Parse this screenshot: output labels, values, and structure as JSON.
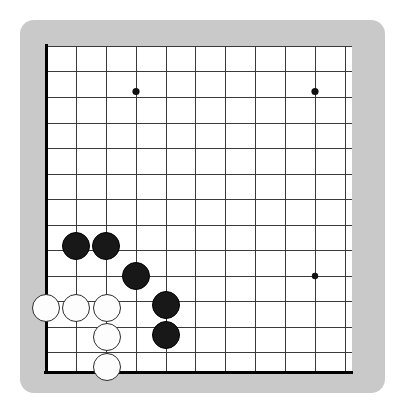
{
  "app": {
    "title": "Go Board",
    "board_type": "go-board",
    "frame_color": "#c9c9c9",
    "surface_color": "#ffffff",
    "line_color": "#3a3a3a",
    "edge_color": "#000000",
    "black_stone_color": "#181818",
    "white_stone_color": "#fdfdfd",
    "white_stone_outline": "#2b2b2b"
  },
  "frame": {
    "x": 20,
    "y": 20,
    "width": 365,
    "height": 373,
    "corner_radius": 14
  },
  "board": {
    "note": "Cropped view of a larger board; only the lower-left portion of the grid is visible",
    "columns_visible": 11,
    "rows_visible": 14,
    "column_spacing": 30,
    "row_spacing": 25.2,
    "origin_x": 46,
    "origin_y": 46.5,
    "left_edge_x": 46,
    "bottom_edge_y": 372,
    "right_cut_x": 352,
    "top_cut_y": 46,
    "vertical_lines_x": [
      46,
      76,
      106,
      136,
      166,
      195,
      225,
      255,
      285,
      315,
      345
    ],
    "horizontal_lines_y": [
      46.5,
      71.5,
      97,
      123,
      148.5,
      174,
      199.5,
      225,
      250.5,
      276,
      301.5,
      327,
      352,
      372
    ],
    "edge_lines": {
      "left": {
        "x": 46,
        "y1": 44,
        "y2": 373
      },
      "bottom": {
        "y": 372,
        "x1": 44,
        "x2": 353
      }
    }
  },
  "star_points": [
    {
      "id": "star-upper-left",
      "x": 136,
      "y": 91.5,
      "r": 3.6
    },
    {
      "id": "star-upper-right",
      "x": 315,
      "y": 91.5,
      "r": 3.6
    },
    {
      "id": "star-lower-right",
      "x": 315,
      "y": 276,
      "r": 3.2
    }
  ],
  "stones": [
    {
      "id": "stone-black-1",
      "color": "black",
      "label": "black-stone",
      "cx": 76,
      "cy": 246,
      "r": 14
    },
    {
      "id": "stone-black-2",
      "color": "black",
      "label": "black-stone",
      "cx": 106,
      "cy": 246,
      "r": 14
    },
    {
      "id": "stone-black-3",
      "color": "black",
      "label": "black-stone",
      "cx": 136,
      "cy": 276,
      "r": 14
    },
    {
      "id": "stone-black-4",
      "color": "black",
      "label": "black-stone",
      "cx": 166,
      "cy": 305,
      "r": 14
    },
    {
      "id": "stone-black-5",
      "color": "black",
      "label": "black-stone",
      "cx": 166,
      "cy": 335,
      "r": 14
    },
    {
      "id": "stone-white-1",
      "color": "white",
      "label": "white-stone",
      "cx": 46,
      "cy": 308,
      "r": 14
    },
    {
      "id": "stone-white-2",
      "color": "white",
      "label": "white-stone",
      "cx": 76,
      "cy": 308,
      "r": 14
    },
    {
      "id": "stone-white-3",
      "color": "white",
      "label": "white-stone",
      "cx": 107,
      "cy": 308,
      "r": 14
    },
    {
      "id": "stone-white-4",
      "color": "white",
      "label": "white-stone",
      "cx": 107,
      "cy": 337,
      "r": 14
    },
    {
      "id": "stone-white-5",
      "color": "white",
      "label": "white-stone",
      "cx": 107,
      "cy": 367,
      "r": 14
    }
  ],
  "counts": {
    "black_stones": 5,
    "white_stones": 5
  },
  "caption": ""
}
